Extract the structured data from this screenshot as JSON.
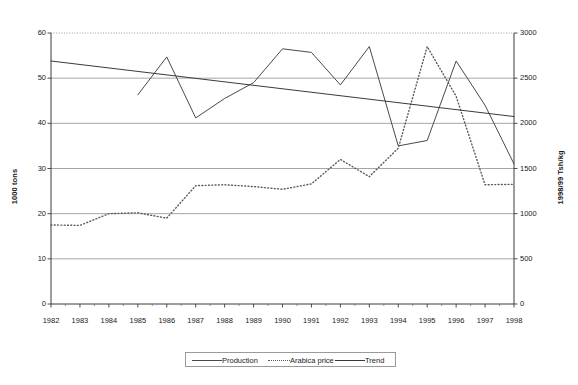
{
  "chart_data": {
    "type": "line",
    "title": "",
    "xlabel": "",
    "ylabel": "1000 tons",
    "y2label": "1998/99 Tsh/kg",
    "grid": true,
    "legend_position": "bottom",
    "categories": [
      "1982",
      "1983",
      "1984",
      "1985",
      "1986",
      "1987",
      "1988",
      "1989",
      "1990",
      "1991",
      "1992",
      "1993",
      "1994",
      "1995",
      "1996",
      "1997",
      "1998"
    ],
    "ylim": [
      0,
      60
    ],
    "yticks": [
      0,
      10,
      20,
      30,
      40,
      50,
      60
    ],
    "y2lim": [
      0,
      3000
    ],
    "y2ticks": [
      0,
      500,
      1000,
      1500,
      2000,
      2500,
      3000
    ],
    "series": [
      {
        "name": "Production",
        "axis": "left",
        "style": "solid",
        "color": "#4a4a4a",
        "x": [
          "1985",
          "1986",
          "1987",
          "1988",
          "1989",
          "1990",
          "1991",
          "1992",
          "1993",
          "1994",
          "1995",
          "1996",
          "1997",
          "1998"
        ],
        "values": [
          46.3,
          54.7,
          41.2,
          45.5,
          49.0,
          56.5,
          55.7,
          48.5,
          57.0,
          35.0,
          36.2,
          53.8,
          44.0,
          31.0
        ]
      },
      {
        "name": "Arabica price",
        "axis": "right",
        "style": "dotted",
        "color": "#5a5a5a",
        "x": [
          "1982",
          "1983",
          "1984",
          "1985",
          "1986",
          "1987",
          "1988",
          "1989",
          "1990",
          "1991",
          "1992",
          "1993",
          "1994",
          "1995",
          "1996",
          "1997",
          "1998"
        ],
        "values": [
          875,
          870,
          1000,
          1010,
          950,
          1310,
          1320,
          1300,
          1270,
          1330,
          1600,
          1410,
          1725,
          2850,
          2300,
          1320,
          1325
        ]
      },
      {
        "name": "Trend",
        "axis": "left",
        "style": "solid",
        "color": "#3a3a3a",
        "x": [
          "1982",
          "1998"
        ],
        "values": [
          53.8,
          41.5
        ]
      }
    ]
  },
  "legend": {
    "production_label": "Production",
    "arabica_label": "Arabica price",
    "trend_label": "Trend"
  }
}
